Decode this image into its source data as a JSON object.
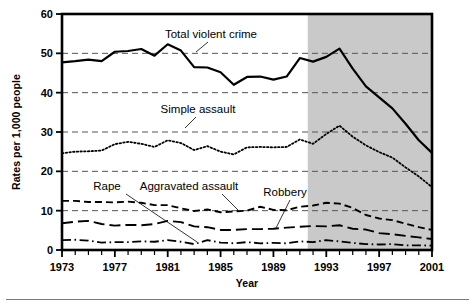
{
  "figure": {
    "background_color": "#ffffff",
    "plot_border_color": "#000000",
    "gridline_color": "#555555",
    "shaded_band_color": "#c9c9c9",
    "shaded_band_start_year": 1991.6,
    "shaded_band_end_year": 2001
  },
  "axes": {
    "y_axis_title": "Rates per 1,000 people",
    "x_axis_title": "Year",
    "y_ticks": [
      0,
      10,
      20,
      30,
      40,
      50,
      60
    ],
    "y_gridlines": [
      10,
      20,
      30,
      40,
      50
    ],
    "x_ticks": [
      1973,
      1974,
      1975,
      1976,
      1977,
      1978,
      1979,
      1980,
      1981,
      1982,
      1983,
      1984,
      1985,
      1986,
      1987,
      1988,
      1989,
      1990,
      1991,
      1992,
      1993,
      1994,
      1995,
      1996,
      1997,
      1998,
      1999,
      2000,
      2001
    ],
    "x_tick_labels": [
      {
        "year": 1973,
        "label": "1973"
      },
      {
        "year": 1977,
        "label": "1977"
      },
      {
        "year": 1981,
        "label": "1981"
      },
      {
        "year": 1985,
        "label": "1985"
      },
      {
        "year": 1989,
        "label": "1989"
      },
      {
        "year": 1993,
        "label": "1993"
      },
      {
        "year": 1997,
        "label": "1997"
      },
      {
        "year": 2001,
        "label": "2001"
      }
    ]
  },
  "annotations": [
    {
      "id": "total-violent-crime",
      "text": "Total violent crime",
      "x": 211,
      "y": 38,
      "leader": [
        [
          208,
          42
        ],
        [
          196,
          52
        ]
      ]
    },
    {
      "id": "simple-assault",
      "text": "Simple assault",
      "x": 198,
      "y": 113,
      "leader": [
        [
          196,
          117
        ],
        [
          185,
          128
        ]
      ]
    },
    {
      "id": "rape",
      "text": "Rape",
      "x": 107,
      "y": 190,
      "leader": [
        [
          126,
          194
        ],
        [
          197,
          242
        ]
      ]
    },
    {
      "id": "aggravated-assault",
      "text": "Aggravated assault",
      "x": 189,
      "y": 190,
      "leader": [
        [
          222,
          194
        ],
        [
          238,
          210
        ]
      ]
    },
    {
      "id": "robbery",
      "text": "Robbery",
      "x": 285,
      "y": 196,
      "leader": [
        [
          290,
          200
        ],
        [
          276,
          228
        ]
      ]
    }
  ],
  "chart_data": {
    "type": "line",
    "title": "",
    "subtitle": "",
    "xlabel": "Year",
    "ylabel": "Rates per 1,000 people",
    "xlim": [
      1973,
      2001
    ],
    "ylim": [
      0,
      60
    ],
    "grid": true,
    "legend_position": "inline-annotations",
    "x": [
      1973,
      1974,
      1975,
      1976,
      1977,
      1978,
      1979,
      1980,
      1981,
      1982,
      1983,
      1984,
      1985,
      1986,
      1987,
      1988,
      1989,
      1990,
      1991,
      1992,
      1993,
      1994,
      1995,
      1996,
      1997,
      1998,
      1999,
      2000,
      2001
    ],
    "series": [
      {
        "name": "Total violent crime",
        "style": "solid",
        "line_width": 2.2,
        "values": [
          47.7,
          48.0,
          48.4,
          48.0,
          50.4,
          50.6,
          51.1,
          49.4,
          52.3,
          50.7,
          46.5,
          46.4,
          45.2,
          42.0,
          44.0,
          44.1,
          43.3,
          44.1,
          48.8,
          47.9,
          49.1,
          51.2,
          46.1,
          41.6,
          38.8,
          36.0,
          32.1,
          27.9,
          24.7
        ]
      },
      {
        "name": "Simple assault",
        "style": "dotted",
        "line_width": 1.8,
        "values": [
          24.6,
          25.0,
          25.1,
          25.3,
          26.9,
          27.5,
          27.0,
          26.2,
          27.9,
          27.2,
          25.4,
          26.4,
          25.0,
          24.3,
          26.1,
          26.2,
          26.1,
          26.2,
          28.1,
          27.0,
          29.5,
          31.6,
          28.8,
          26.6,
          24.9,
          23.5,
          21.0,
          18.7,
          16.0
        ]
      },
      {
        "name": "Aggravated assault",
        "style": "dashed",
        "line_width": 1.9,
        "values": [
          12.5,
          12.5,
          12.2,
          12.2,
          12.1,
          12.3,
          12.0,
          11.4,
          11.4,
          10.6,
          9.9,
          10.3,
          9.6,
          9.8,
          10.0,
          11.0,
          10.2,
          10.1,
          11.0,
          11.3,
          12.0,
          11.8,
          10.7,
          8.9,
          8.0,
          7.6,
          6.7,
          5.8,
          5.1
        ]
      },
      {
        "name": "Robbery",
        "style": "long-dash",
        "line_width": 1.9,
        "values": [
          6.8,
          7.2,
          7.4,
          6.6,
          6.2,
          6.4,
          6.3,
          6.6,
          7.4,
          7.1,
          6.0,
          5.8,
          5.1,
          5.1,
          5.3,
          5.3,
          5.4,
          5.7,
          5.9,
          6.1,
          6.0,
          6.3,
          5.4,
          5.2,
          4.3,
          4.0,
          3.6,
          3.2,
          2.8
        ]
      },
      {
        "name": "Rape",
        "style": "dash-dot",
        "line_width": 1.8,
        "values": [
          2.5,
          2.6,
          2.4,
          1.9,
          2.0,
          2.0,
          2.2,
          2.1,
          2.5,
          2.1,
          1.5,
          2.5,
          1.9,
          1.7,
          2.0,
          1.7,
          1.8,
          1.7,
          2.2,
          2.0,
          2.5,
          2.2,
          1.8,
          1.5,
          1.4,
          1.5,
          1.2,
          1.2,
          1.1
        ]
      }
    ]
  }
}
